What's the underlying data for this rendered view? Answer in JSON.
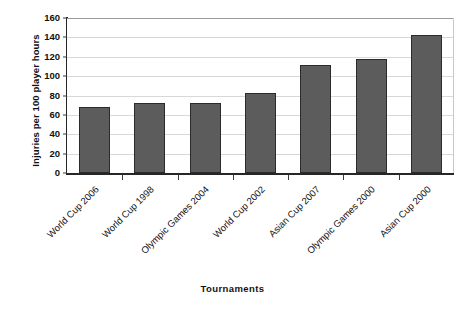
{
  "chart_data": {
    "type": "bar",
    "title": "",
    "xlabel": "Tournaments",
    "ylabel": "Injuries per 100 player hours",
    "categories": [
      "World Cup 2006",
      "World Cup 1998",
      "Olympic Games 2004",
      "World Cup 2002",
      "Asian Cup 2007",
      "Olympic Games 2000",
      "Asian Cup 2000"
    ],
    "values": [
      68,
      72,
      72.5,
      82.5,
      112,
      118,
      142
    ],
    "ylim": [
      0,
      160
    ],
    "ytick_values": [
      0,
      20,
      40,
      60,
      80,
      100,
      120,
      140,
      160
    ],
    "ytick_labels": [
      "0",
      "20",
      "40",
      "60",
      "80",
      "100",
      "120",
      "140",
      "160"
    ],
    "grid": true,
    "grid_axis": "y",
    "legend": false,
    "legend_position": "none",
    "bar_color": "#5c5c5c",
    "bar_edge_color": "#2b2b2b",
    "gridline_color": "#d8d8d8",
    "axis_color": "#262626",
    "background_color": "#ffffff"
  }
}
